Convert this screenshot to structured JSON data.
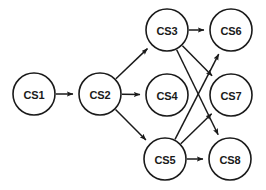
{
  "diagram": {
    "type": "directed-graph",
    "background_color": "#ffffff",
    "node_fill": "#ffffff",
    "node_stroke": "#1a1a1a",
    "edge_color": "#1a1a1a",
    "node_radius": 21,
    "nodes": [
      {
        "id": "CS1",
        "label": "CS1",
        "cx": 34,
        "cy": 94
      },
      {
        "id": "CS2",
        "label": "CS2",
        "cx": 100,
        "cy": 94
      },
      {
        "id": "CS3",
        "label": "CS3",
        "cx": 167,
        "cy": 30
      },
      {
        "id": "CS4",
        "label": "CS4",
        "cx": 167,
        "cy": 95
      },
      {
        "id": "CS5",
        "label": "CS5",
        "cx": 165,
        "cy": 159
      },
      {
        "id": "CS6",
        "label": "CS6",
        "cx": 231,
        "cy": 30
      },
      {
        "id": "CS7",
        "label": "CS7",
        "cx": 231,
        "cy": 95
      },
      {
        "id": "CS8",
        "label": "CS8",
        "cx": 230,
        "cy": 159
      }
    ],
    "edges": [
      {
        "from": "CS1",
        "to": "CS2"
      },
      {
        "from": "CS2",
        "to": "CS3"
      },
      {
        "from": "CS2",
        "to": "CS4"
      },
      {
        "from": "CS2",
        "to": "CS5"
      },
      {
        "from": "CS3",
        "to": "CS6"
      },
      {
        "from": "CS3",
        "to": "CS7"
      },
      {
        "from": "CS3",
        "to": "CS8"
      },
      {
        "from": "CS5",
        "to": "CS6"
      },
      {
        "from": "CS5",
        "to": "CS7"
      },
      {
        "from": "CS5",
        "to": "CS8"
      }
    ]
  }
}
